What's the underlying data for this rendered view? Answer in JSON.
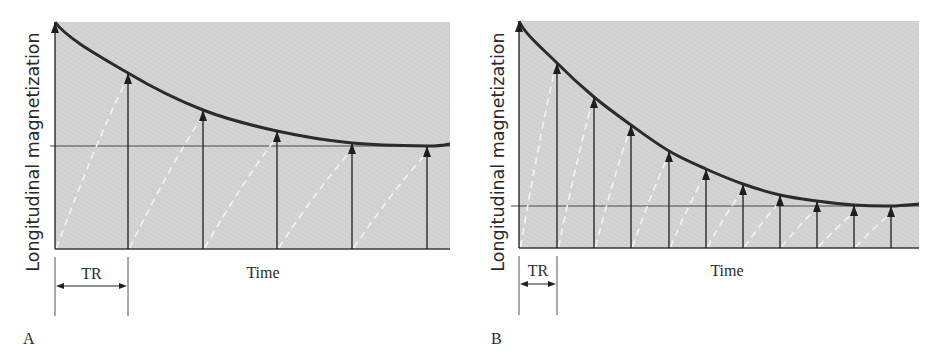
{
  "figure": {
    "background_color": "#ffffff",
    "plot_fill": "#d4d4d4",
    "hatch_color": "#c6c6c6",
    "curve_color": "#2b2b2b",
    "arrow_color": "#1e1e1e",
    "dash_color": "#f4f4f4",
    "ref_line_color": "#4a4a4a"
  },
  "panels": [
    {
      "id": "A",
      "panel_label": "A",
      "ylabel": "Longitudinal magnetization",
      "xlabel": "Time",
      "tr_label": "TR",
      "plot": {
        "x0": 55,
        "x1": 450,
        "y_top": 22,
        "y_base": 249
      },
      "ref_line_y": 146,
      "ref_line_x0": 50,
      "arrows_x": [
        55,
        128,
        203,
        277,
        352,
        427
      ],
      "arrows_tip_y": [
        22,
        73,
        110,
        131,
        143,
        146
      ],
      "tr": {
        "x0": 55,
        "x1": 128,
        "tick_y0": 257,
        "tick_y1": 316,
        "arrow_y": 286,
        "text_y": 279
      },
      "xlabel_pos": {
        "x": 263,
        "y": 278
      },
      "panel_label_pos": {
        "x": 23,
        "y": 344
      },
      "ylabel_pos": {
        "x": 33,
        "y": 152
      }
    },
    {
      "id": "B",
      "panel_label": "B",
      "ylabel": "Longitudinal magnetization",
      "xlabel": "Time",
      "tr_label": "TR",
      "plot": {
        "x0": 519,
        "x1": 919,
        "y_top": 21,
        "y_base": 248
      },
      "ref_line_y": 206,
      "ref_line_x0": 511,
      "arrows_x": [
        519,
        557,
        594,
        631,
        669,
        706,
        743,
        780,
        817,
        854,
        891
      ],
      "arrows_tip_y": [
        21,
        63,
        97,
        125,
        151,
        169,
        184,
        195,
        201,
        205,
        206
      ],
      "tr": {
        "x0": 519,
        "x1": 557,
        "tick_y0": 256,
        "tick_y1": 315,
        "arrow_y": 284,
        "text_y": 276
      },
      "xlabel_pos": {
        "x": 727,
        "y": 276
      },
      "panel_label_pos": {
        "x": 491,
        "y": 344
      },
      "ylabel_pos": {
        "x": 498,
        "y": 152
      }
    }
  ],
  "chart_data": [
    {
      "type": "line",
      "title": "A",
      "xlabel": "Time",
      "ylabel": "Longitudinal magnetization",
      "annotation": "TR (long repetition time)",
      "x": [
        0,
        1,
        2,
        3,
        4,
        5
      ],
      "series": [
        {
          "name": "Longitudinal magnetization at each RF pulse (envelope)",
          "values": [
            1.0,
            0.78,
            0.61,
            0.52,
            0.47,
            0.45
          ]
        }
      ],
      "steady_state": 0.45,
      "grid": false
    },
    {
      "type": "line",
      "title": "B",
      "xlabel": "Time",
      "ylabel": "Longitudinal magnetization",
      "annotation": "TR (short repetition time)",
      "x": [
        0,
        1,
        2,
        3,
        4,
        5,
        6,
        7,
        8,
        9,
        10
      ],
      "series": [
        {
          "name": "Longitudinal magnetization at each RF pulse (envelope)",
          "values": [
            1.0,
            0.81,
            0.66,
            0.54,
            0.43,
            0.35,
            0.28,
            0.23,
            0.21,
            0.19,
            0.185
          ]
        }
      ],
      "steady_state": 0.185,
      "grid": false
    }
  ]
}
